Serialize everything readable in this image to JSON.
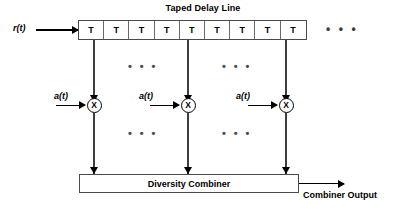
{
  "diagram": {
    "title": "Taped Delay Line",
    "input_label": "r(t)",
    "output_label": "Combiner Output",
    "combiner_label": "Diversity Combiner",
    "tail_ellipsis": "• • •",
    "column_ellipsis": "• • •",
    "delay_line": {
      "cell_label": "T",
      "cells": [
        "T",
        "T",
        "T",
        "T",
        "T",
        "T",
        "T",
        "T",
        "T"
      ]
    },
    "branches": [
      {
        "weight_label": "a(t)",
        "multiplier_symbol": "X"
      },
      {
        "weight_label": "a(t)",
        "multiplier_symbol": "X"
      },
      {
        "weight_label": "a(t)",
        "multiplier_symbol": "X"
      }
    ],
    "ellipsis_groups": [
      {
        "position": "upper-left"
      },
      {
        "position": "upper-right"
      },
      {
        "position": "lower-left"
      },
      {
        "position": "lower-right"
      }
    ],
    "colors": {
      "line": "#3d3d3d",
      "box_border": "#4a4a4a",
      "text": "#000000",
      "background": "#ffffff"
    }
  }
}
